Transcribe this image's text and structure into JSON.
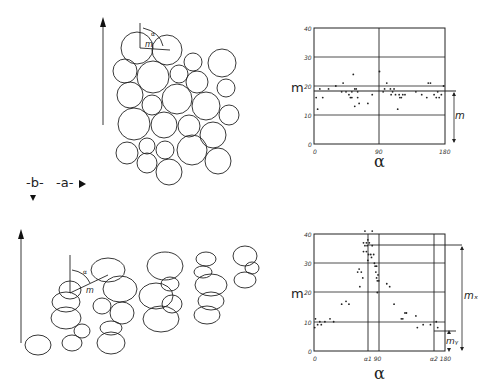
{
  "legend": {
    "b_label": "-b-",
    "a_label": "-a-"
  },
  "panel_top": {
    "sketch_labels": {
      "alpha": "α",
      "m": "m"
    },
    "chart_ylabel": "m",
    "chart_xlabel": "α",
    "right_bracket_label": "m"
  },
  "panel_bottom": {
    "sketch_labels": {
      "alpha": "α",
      "m": "m"
    },
    "chart_ylabel": "m",
    "chart_xlabel": "α",
    "bracket_mx": "mₓ",
    "bracket_my": "mᵧ"
  },
  "chart_data": [
    {
      "type": "scatter",
      "title": "",
      "xlabel": "α",
      "ylabel": "m",
      "xlim": [
        0,
        180
      ],
      "ylim": [
        0,
        40
      ],
      "x_ticks": [
        "0",
        "90",
        "180"
      ],
      "y_ticks": [
        "0",
        "10",
        "20",
        "30",
        "40"
      ],
      "grid": true,
      "reference_lines": {
        "horizontal": [
          18,
          20
        ],
        "vertical": [
          90
        ]
      },
      "annotation": "m (bracket from 0 to 18)",
      "points": [
        [
          3,
          16
        ],
        [
          5,
          12
        ],
        [
          8,
          19
        ],
        [
          12,
          16
        ],
        [
          20,
          19
        ],
        [
          30,
          20
        ],
        [
          38,
          18
        ],
        [
          40,
          21
        ],
        [
          44,
          18
        ],
        [
          48,
          17
        ],
        [
          50,
          16
        ],
        [
          52,
          18
        ],
        [
          52,
          16
        ],
        [
          54,
          24
        ],
        [
          56,
          19
        ],
        [
          56,
          13
        ],
        [
          58,
          19
        ],
        [
          60,
          18
        ],
        [
          60,
          16
        ],
        [
          62,
          14
        ],
        [
          74,
          14
        ],
        [
          80,
          17
        ],
        [
          90,
          25
        ],
        [
          95,
          18
        ],
        [
          97,
          19
        ],
        [
          100,
          21
        ],
        [
          105,
          19
        ],
        [
          106,
          17
        ],
        [
          108,
          18
        ],
        [
          110,
          19
        ],
        [
          112,
          17
        ],
        [
          115,
          12
        ],
        [
          117,
          17
        ],
        [
          118,
          16
        ],
        [
          120,
          16
        ],
        [
          122,
          17
        ],
        [
          125,
          17
        ],
        [
          140,
          18
        ],
        [
          148,
          17
        ],
        [
          155,
          16
        ],
        [
          157,
          21
        ],
        [
          160,
          21
        ],
        [
          165,
          17
        ],
        [
          168,
          16
        ],
        [
          170,
          18
        ],
        [
          172,
          16
        ],
        [
          175,
          17
        ],
        [
          178,
          20
        ]
      ]
    },
    {
      "type": "scatter",
      "title": "",
      "xlabel": "α",
      "ylabel": "m",
      "xlim": [
        0,
        180
      ],
      "ylim": [
        0,
        40
      ],
      "x_ticks": [
        "0",
        "α1 90",
        "α2 180"
      ],
      "y_ticks": [
        "0",
        "10",
        "20",
        "30",
        "40"
      ],
      "grid": true,
      "reference_lines": {
        "horizontal": [
          36,
          10,
          7
        ],
        "vertical": [
          75,
          90,
          165
        ]
      },
      "annotation": "mx (bracket 0–36), my (bracket 0–7)",
      "points": [
        [
          1,
          8
        ],
        [
          2,
          11
        ],
        [
          5,
          9
        ],
        [
          8,
          10
        ],
        [
          10,
          9
        ],
        [
          15,
          10
        ],
        [
          22,
          11
        ],
        [
          27,
          10
        ],
        [
          38,
          16
        ],
        [
          44,
          17
        ],
        [
          48,
          16
        ],
        [
          60,
          27
        ],
        [
          62,
          28
        ],
        [
          63,
          22
        ],
        [
          65,
          27
        ],
        [
          67,
          25
        ],
        [
          68,
          34
        ],
        [
          68,
          37
        ],
        [
          70,
          36
        ],
        [
          70,
          41
        ],
        [
          72,
          34
        ],
        [
          72,
          37
        ],
        [
          73,
          36
        ],
        [
          74,
          31
        ],
        [
          74,
          38
        ],
        [
          75,
          33
        ],
        [
          76,
          37
        ],
        [
          78,
          33
        ],
        [
          79,
          32
        ],
        [
          80,
          41
        ],
        [
          80,
          36
        ],
        [
          82,
          33
        ],
        [
          83,
          30
        ],
        [
          84,
          29
        ],
        [
          85,
          27
        ],
        [
          86,
          25
        ],
        [
          86,
          29
        ],
        [
          87,
          20
        ],
        [
          87,
          24
        ],
        [
          88,
          26
        ],
        [
          89,
          24
        ],
        [
          100,
          23
        ],
        [
          104,
          22
        ],
        [
          110,
          16
        ],
        [
          120,
          11
        ],
        [
          122,
          11
        ],
        [
          125,
          13
        ],
        [
          127,
          13
        ],
        [
          140,
          12
        ],
        [
          142,
          8
        ],
        [
          150,
          9
        ],
        [
          160,
          9
        ],
        [
          168,
          10
        ],
        [
          170,
          8
        ]
      ]
    }
  ]
}
